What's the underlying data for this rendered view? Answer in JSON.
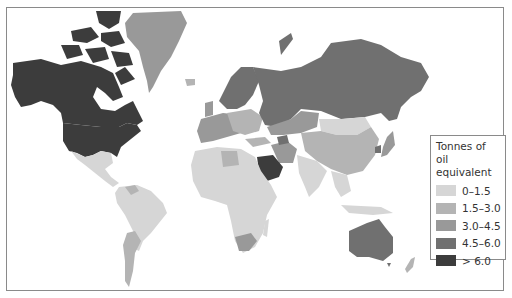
{
  "map": {
    "type": "choropleth",
    "projection": "world",
    "legend": {
      "title_line1": "Tonnes of oil",
      "title_line2": "equivalent",
      "classes": [
        {
          "label": "0–1.5",
          "color": "#d6d6d6"
        },
        {
          "label": "1.5–3.0",
          "color": "#b4b4b4"
        },
        {
          "label": "3.0–4.5",
          "color": "#999999"
        },
        {
          "label": "4.5–6.0",
          "color": "#707070"
        },
        {
          "label": "> 6.0",
          "color": "#3c3c3c"
        }
      ]
    },
    "regions": [
      {
        "name": "Canada",
        "class": "> 6.0"
      },
      {
        "name": "United States",
        "class": "> 6.0"
      },
      {
        "name": "Alaska",
        "class": "> 6.0"
      },
      {
        "name": "Greenland",
        "class": "3.0–4.5"
      },
      {
        "name": "Mexico",
        "class": "0–1.5"
      },
      {
        "name": "Central America",
        "class": "0–1.5"
      },
      {
        "name": "Venezuela",
        "class": "1.5–3.0"
      },
      {
        "name": "South America",
        "class": "0–1.5"
      },
      {
        "name": "Argentina",
        "class": "1.5–3.0"
      },
      {
        "name": "Scandinavia",
        "class": "4.5–6.0"
      },
      {
        "name": "Western Europe",
        "class": "3.0–4.5"
      },
      {
        "name": "Eastern Europe",
        "class": "1.5–3.0"
      },
      {
        "name": "Russia",
        "class": "4.5–6.0"
      },
      {
        "name": "Kazakhstan",
        "class": "3.0–4.5"
      },
      {
        "name": "Mongolia",
        "class": "0–1.5"
      },
      {
        "name": "China",
        "class": "1.5–3.0"
      },
      {
        "name": "Japan",
        "class": "3.0–4.5"
      },
      {
        "name": "South Korea",
        "class": "4.5–6.0"
      },
      {
        "name": "Iran",
        "class": "3.0–4.5"
      },
      {
        "name": "Saudi Arabia",
        "class": "> 6.0"
      },
      {
        "name": "Africa",
        "class": "0–1.5"
      },
      {
        "name": "Libya",
        "class": "1.5–3.0"
      },
      {
        "name": "South Africa",
        "class": "3.0–4.5"
      },
      {
        "name": "India",
        "class": "0–1.5"
      },
      {
        "name": "Southeast Asia",
        "class": "0–1.5"
      },
      {
        "name": "Australia",
        "class": "4.5–6.0"
      },
      {
        "name": "New Zealand",
        "class": "1.5–3.0"
      }
    ]
  }
}
